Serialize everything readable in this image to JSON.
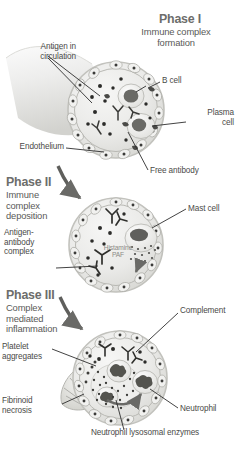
{
  "figure": {
    "background_color": "#ffffff",
    "ink_color": "#3a3a3a",
    "vessel_fill": "#e9e9e7",
    "vessel_wall": "#cfcfcb",
    "nucleus_color": "#5f5f5c",
    "leader_color": "#2e2e2e"
  },
  "phases": [
    {
      "id": "phase-1",
      "title": "Phase I",
      "subtitle": "Immune complex\nformation",
      "labels": [
        {
          "id": "antigen-in-circulation",
          "text": "Antigen in\ncirculation"
        },
        {
          "id": "b-cell",
          "text": "B cell"
        },
        {
          "id": "plasma-cell",
          "text": "Plasma\ncell"
        },
        {
          "id": "endothelium",
          "text": "Endothelium"
        },
        {
          "id": "free-antibody",
          "text": "Free antibody"
        }
      ]
    },
    {
      "id": "phase-2",
      "title": "Phase II",
      "subtitle": "Immune\ncomplex\ndeposition",
      "labels": [
        {
          "id": "antigen-antibody-complex",
          "text": "Antigen-\nantibody\ncomplex"
        },
        {
          "id": "mast-cell",
          "text": "Mast cell"
        }
      ],
      "inner_notes": [
        {
          "id": "histamine-paf",
          "text": "Histamine\nPAF"
        }
      ]
    },
    {
      "id": "phase-3",
      "title": "Phase III",
      "subtitle": "Complex\nmediated\ninflammation",
      "labels": [
        {
          "id": "complement",
          "text": "Complement"
        },
        {
          "id": "platelet-aggregates",
          "text": "Platelet\naggregates"
        },
        {
          "id": "fibrinoid-necrosis",
          "text": "Fibrinoid\nnecrosis"
        },
        {
          "id": "neutrophil",
          "text": "Neutrophil"
        },
        {
          "id": "neutrophil-lysosomal-enzymes",
          "text": "Neutrophil lysosomal enzymes"
        }
      ]
    }
  ]
}
